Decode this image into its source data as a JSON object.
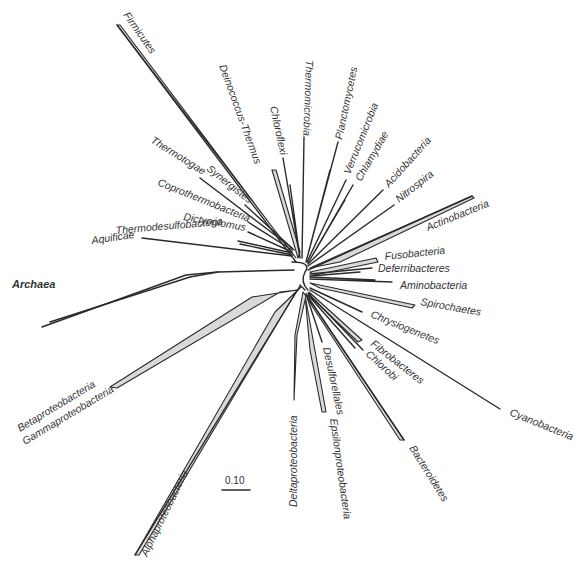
{
  "figure": {
    "type": "unrooted phylogenetic tree",
    "scale_bar": {
      "label": "0.10"
    }
  },
  "taxa": {
    "firmicutes": "Firmicutes",
    "deinococcus": "Deinococcus-Thermus",
    "chloroflexi": "Chloroflexi",
    "thermomicrobia": "Thermomicrobia",
    "planctomycetes": "Planctomycetes",
    "verrucomicrobia": "Verrucomicrobia",
    "chlamydiae": "Chlamydiae",
    "acidobacteria": "Acidobacteria",
    "nitrospira": "Nitrospira",
    "actinobacteria": "Actinobacteria",
    "fusobacteria": "Fusobacteria",
    "deferribacteres": "Deferribacteres",
    "aminobacteria": "Aminobacteria",
    "spirochaetes": "Spirochaetes",
    "chrysiogenetes": "Chrysiogenetes",
    "fibrobacteres": "Fibrobacteres",
    "chlorobi": "Chlorobi",
    "cyanobacteria": "Cyanobacteria",
    "bacteroidetes": "Bacteroidetes",
    "epsilonproteobacteria": "Epsilonproteobacteria",
    "desulfurellales": "Desulforellales",
    "deltaproteobacteria": "Deltaproteobacteria",
    "alphaproteobacteria": "Alphaproteobacteria",
    "betaproteobacteria": "Betaproteobacteria",
    "gammaproteobacteria": "Gammaproteobacteria",
    "archaea": "Archaea",
    "aquificae": "Aquificae",
    "thermodesulfobacteria": "Thermodesulfobacteria",
    "dictyoglomus": "Dictyoglomus",
    "coprothermobacteria": "Coprothermobacteria",
    "thermotogae": "Thermotogae",
    "synergistes": "Synergistes"
  }
}
